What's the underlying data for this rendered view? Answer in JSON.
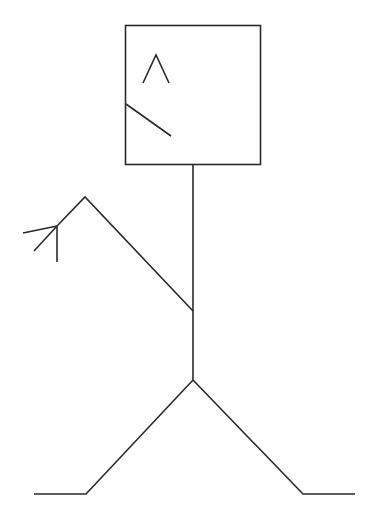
{
  "figure": {
    "stroke_color": "#2a2a2a",
    "background_color": "#ffffff",
    "parts": [
      "head-box",
      "eye-caret",
      "mouth-line",
      "body",
      "raised-arm",
      "hand-fingers",
      "left-leg",
      "right-leg"
    ]
  }
}
